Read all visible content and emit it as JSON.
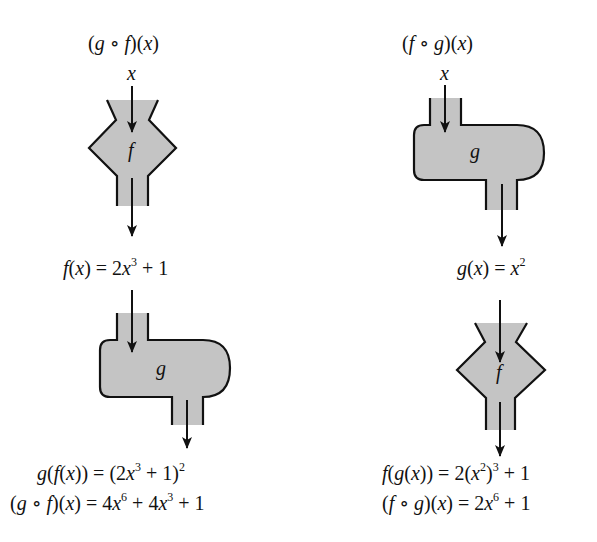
{
  "colors": {
    "fill": "#c4c4c4",
    "stroke": "#111111",
    "background": "#ffffff"
  },
  "left": {
    "title": {
      "pre": "(",
      "g": "g",
      "op": " ∘ ",
      "f": "f",
      "post": ")(",
      "x": "x",
      "end": ")"
    },
    "input": "x",
    "machine1": {
      "label": "f",
      "shape": "funnel-diamond"
    },
    "intermediate": {
      "f": "f",
      "open": "(",
      "x": "x",
      "mid": ") = 2",
      "x2": "x",
      "exp": "3",
      "tail": " + 1"
    },
    "machine2": {
      "label": "g",
      "shape": "rounded-tank"
    },
    "result1": {
      "g": "g",
      "p1": "(",
      "f": "f",
      "p2": "(",
      "x": "x",
      "p3": ")) = (2",
      "x2": "x",
      "exp1": "3",
      "p4": " + 1)",
      "exp2": "2"
    },
    "result2": {
      "p1": "(",
      "g": "g",
      "op": " ∘ ",
      "f": "f",
      "p2": ")(",
      "x": "x",
      "p3": ") = 4",
      "x2": "x",
      "exp1": "6",
      "p4": " + 4",
      "x3": "x",
      "exp2": "3",
      "p5": " + 1"
    }
  },
  "right": {
    "title": {
      "pre": "(",
      "f": "f",
      "op": " ∘ ",
      "g": "g",
      "post": ")(",
      "x": "x",
      "end": ")"
    },
    "input": "x",
    "machine1": {
      "label": "g",
      "shape": "rounded-tank"
    },
    "intermediate": {
      "g": "g",
      "open": "(",
      "x": "x",
      "mid": ") = ",
      "x2": "x",
      "exp": "2"
    },
    "machine2": {
      "label": "f",
      "shape": "funnel-diamond"
    },
    "result1": {
      "f": "f",
      "p1": "(",
      "g": "g",
      "p2": "(",
      "x": "x",
      "p3": ")) = 2(",
      "x2": "x",
      "exp1": "2",
      "p4": ")",
      "exp2": "3",
      "p5": " + 1"
    },
    "result2": {
      "p1": "(",
      "f": "f",
      "op": " ∘ ",
      "g": "g",
      "p2": ")(",
      "x": "x",
      "p3": ") = 2",
      "x2": "x",
      "exp1": "6",
      "p4": " + 1"
    }
  }
}
